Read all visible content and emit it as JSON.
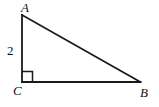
{
  "figure": {
    "kind": "right-triangle-diagram",
    "background_color": "#ffffff",
    "stroke_color": "#1a1a1a",
    "stroke_width": 1.8,
    "canvas": {
      "width": 159,
      "height": 107
    },
    "vertices": {
      "A": {
        "x": 22,
        "y": 15,
        "label": "A"
      },
      "B": {
        "x": 140,
        "y": 82,
        "label": "B"
      },
      "C": {
        "x": 22,
        "y": 82,
        "label": "C"
      }
    },
    "sides": [
      {
        "name": "AC",
        "from": "A",
        "to": "C",
        "label": "2",
        "label_shown": true
      },
      {
        "name": "CB",
        "from": "C",
        "to": "B",
        "label": "",
        "label_shown": false
      },
      {
        "name": "AB",
        "from": "A",
        "to": "B",
        "label": "",
        "label_shown": false
      }
    ],
    "right_angle": {
      "at_vertex": "C",
      "marker": "square",
      "size": 10,
      "shown": true
    },
    "labels": {
      "vertex_a": "A",
      "vertex_b": "B",
      "vertex_c": "C",
      "side_ac_length": "2"
    }
  }
}
